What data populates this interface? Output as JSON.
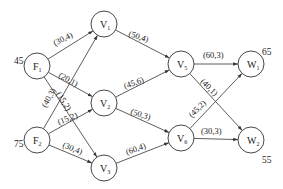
{
  "diagram": {
    "type": "flow-network",
    "nodes": [
      {
        "id": "F1",
        "main": "F",
        "sub": "1",
        "x": 37,
        "y": 66,
        "supply": "45",
        "supply_pos": [
          14,
          64
        ]
      },
      {
        "id": "F2",
        "main": "F",
        "sub": "2",
        "x": 37,
        "y": 140,
        "supply": "75",
        "supply_pos": [
          14,
          147
        ]
      },
      {
        "id": "V1",
        "main": "V",
        "sub": "1",
        "x": 104,
        "y": 24
      },
      {
        "id": "V2",
        "main": "V",
        "sub": "2",
        "x": 104,
        "y": 103
      },
      {
        "id": "V3",
        "main": "V",
        "sub": "3",
        "x": 104,
        "y": 168
      },
      {
        "id": "V5",
        "main": "V",
        "sub": "5",
        "x": 181,
        "y": 64
      },
      {
        "id": "V6",
        "main": "V",
        "sub": "6",
        "x": 181,
        "y": 138
      },
      {
        "id": "W1",
        "main": "W",
        "sub": "1",
        "x": 251,
        "y": 64,
        "demand": "65",
        "demand_pos": [
          262,
          55
        ]
      },
      {
        "id": "W2",
        "main": "W",
        "sub": "2",
        "x": 251,
        "y": 140,
        "demand": "55",
        "demand_pos": [
          262,
          163
        ]
      }
    ],
    "edges": [
      {
        "from": "F1",
        "to": "V1",
        "label": "(30,4)",
        "lx": 55,
        "ly": 46,
        "rot": -27
      },
      {
        "from": "F1",
        "to": "V2",
        "label": "(20,1)",
        "lx": 58,
        "ly": 77,
        "rot": 29
      },
      {
        "from": "F1",
        "to": "V3",
        "label": "(15,2)",
        "lx": 56,
        "ly": 94,
        "rot": 58
      },
      {
        "from": "F2",
        "to": "V1",
        "label": "(40,3)",
        "lx": 46,
        "ly": 108,
        "rot": -60
      },
      {
        "from": "F2",
        "to": "V2",
        "label": "(15,2)",
        "lx": 59,
        "ly": 125,
        "rot": -22
      },
      {
        "from": "F2",
        "to": "V3",
        "label": "(30,4)",
        "lx": 62,
        "ly": 147,
        "rot": 22
      },
      {
        "from": "V1",
        "to": "V5",
        "label": "(50,4)",
        "lx": 128,
        "ly": 36,
        "rot": 18
      },
      {
        "from": "V2",
        "to": "V5",
        "label": "(45,6)",
        "lx": 125,
        "ly": 89,
        "rot": -20
      },
      {
        "from": "V2",
        "to": "V6",
        "label": "(50,3)",
        "lx": 130,
        "ly": 114,
        "rot": 17
      },
      {
        "from": "V3",
        "to": "V6",
        "label": "(60,4)",
        "lx": 127,
        "ly": 155,
        "rot": -20
      },
      {
        "from": "V5",
        "to": "W1",
        "label": "(60,3)",
        "lx": 203,
        "ly": 58,
        "rot": 0
      },
      {
        "from": "V5",
        "to": "W2",
        "label": "(40,1)",
        "lx": 200,
        "ly": 82,
        "rot": 45
      },
      {
        "from": "V6",
        "to": "W1",
        "label": "(45,2)",
        "lx": 192,
        "ly": 118,
        "rot": -45
      },
      {
        "from": "V6",
        "to": "W2",
        "label": "(30,3)",
        "lx": 201,
        "ly": 134,
        "rot": 0
      }
    ]
  }
}
